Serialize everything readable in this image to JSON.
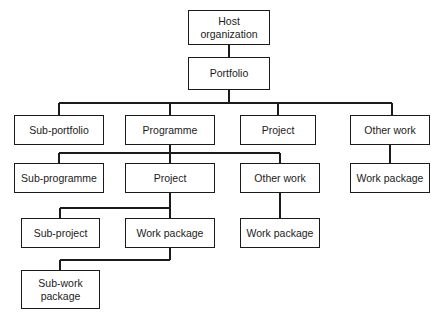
{
  "diagram": {
    "type": "tree-hierarchy",
    "canvas": {
      "width": 446,
      "height": 319
    },
    "style": {
      "background_color": "#ffffff",
      "box_fill": "#ffffff",
      "box_border_color": "#1b1b1b",
      "line_color": "#1b1b1b",
      "text_color": "#1b1b1b"
    },
    "nodes": [
      {
        "id": "host-organization",
        "label": "Host\norganization",
        "x": 188,
        "y": 10,
        "w": 82,
        "h": 35,
        "level": 1
      },
      {
        "id": "portfolio",
        "label": "Portfolio",
        "x": 188,
        "y": 57,
        "w": 82,
        "h": 33,
        "level": 2
      },
      {
        "id": "sub-portfolio",
        "label": "Sub-portfolio",
        "x": 14,
        "y": 115,
        "w": 90,
        "h": 30,
        "level": 3
      },
      {
        "id": "programme",
        "label": "Programme",
        "x": 125,
        "y": 115,
        "w": 90,
        "h": 30,
        "level": 3
      },
      {
        "id": "project-l3",
        "label": "Project",
        "x": 240,
        "y": 115,
        "w": 76,
        "h": 30,
        "level": 3
      },
      {
        "id": "other-work-l3",
        "label": "Other work",
        "x": 350,
        "y": 115,
        "w": 80,
        "h": 30,
        "level": 3
      },
      {
        "id": "sub-programme",
        "label": "Sub-programme",
        "x": 14,
        "y": 163,
        "w": 90,
        "h": 30,
        "level": 4
      },
      {
        "id": "project-l4",
        "label": "Project",
        "x": 125,
        "y": 163,
        "w": 90,
        "h": 30,
        "level": 4
      },
      {
        "id": "other-work-l4",
        "label": "Other work",
        "x": 240,
        "y": 163,
        "w": 80,
        "h": 30,
        "level": 4
      },
      {
        "id": "work-package-r4",
        "label": "Work package",
        "x": 350,
        "y": 163,
        "w": 80,
        "h": 30,
        "level": 4
      },
      {
        "id": "sub-project",
        "label": "Sub-project",
        "x": 21,
        "y": 218,
        "w": 79,
        "h": 30,
        "level": 5
      },
      {
        "id": "work-package-l5",
        "label": "Work package",
        "x": 125,
        "y": 218,
        "w": 90,
        "h": 30,
        "level": 5
      },
      {
        "id": "work-package-m5",
        "label": "Work package",
        "x": 240,
        "y": 218,
        "w": 80,
        "h": 30,
        "level": 5
      },
      {
        "id": "sub-work-package",
        "label": "Sub-work\npackage",
        "x": 21,
        "y": 270,
        "w": 79,
        "h": 39,
        "level": 6
      }
    ],
    "edges": [
      {
        "id": "edge-host-to-portfolio",
        "from": "host-organization",
        "to": "portfolio",
        "path": "M 229 45 L 229 57"
      },
      {
        "id": "edge-portfolio-bus",
        "from": "portfolio",
        "to": "level-3-bus",
        "path": "M 229 90 L 229 103 M 59 103 L 392 103"
      },
      {
        "id": "edge-bus-to-sub-portfolio",
        "from": "level-3-bus",
        "to": "sub-portfolio",
        "path": "M 59 103 L 59 115"
      },
      {
        "id": "edge-bus-to-programme",
        "from": "level-3-bus",
        "to": "programme",
        "path": "M 170 103 L 170 115"
      },
      {
        "id": "edge-bus-to-project-l3",
        "from": "level-3-bus",
        "to": "project-l3",
        "path": "M 278 103 L 278 115"
      },
      {
        "id": "edge-bus-to-other-work-l3",
        "from": "level-3-bus",
        "to": "other-work-l3",
        "path": "M 392 103 L 392 115"
      },
      {
        "id": "edge-programme-bus",
        "from": "programme",
        "to": "level-4-bus",
        "path": "M 170 145 L 170 153 M 59 153 L 280 153"
      },
      {
        "id": "edge-bus-to-sub-programme",
        "from": "level-4-bus",
        "to": "sub-programme",
        "path": "M 59 153 L 59 163"
      },
      {
        "id": "edge-bus-to-project-l4",
        "from": "level-4-bus",
        "to": "project-l4",
        "path": "M 170 153 L 170 163"
      },
      {
        "id": "edge-bus-to-other-work-l4",
        "from": "level-4-bus",
        "to": "other-work-l4",
        "path": "M 280 153 L 280 163"
      },
      {
        "id": "edge-other-work-l3-to-work-pkg-r4",
        "from": "other-work-l3",
        "to": "work-package-r4",
        "path": "M 390 145 L 390 163"
      },
      {
        "id": "edge-project-l4-bus",
        "from": "project-l4",
        "to": "level-5-bus",
        "path": "M 170 193 L 170 208 M 60 208 L 170 208"
      },
      {
        "id": "edge-bus-to-sub-project",
        "from": "level-5-bus",
        "to": "sub-project",
        "path": "M 60 208 L 60 218"
      },
      {
        "id": "edge-bus-to-work-package-l5",
        "from": "level-5-bus",
        "to": "work-package-l5",
        "path": "M 170 208 L 170 218"
      },
      {
        "id": "edge-other-work-l4-to-work-pkg-m5",
        "from": "other-work-l4",
        "to": "work-package-m5",
        "path": "M 280 193 L 280 218"
      },
      {
        "id": "edge-work-pkg-l5-to-sub-work-pkg",
        "from": "work-package-l5",
        "to": "sub-work-package",
        "path": "M 170 248 L 170 260 M 60 260 L 170 260 M 60 260 L 60 270"
      }
    ]
  }
}
